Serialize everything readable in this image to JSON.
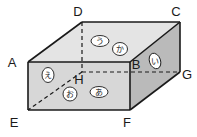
{
  "figure": {
    "shape_type": "cuboid",
    "background_color": "#ffffff",
    "edge_color": "#1a1a1a",
    "vertices": [
      {
        "id": "A",
        "label": "A",
        "x": 28,
        "y": 62,
        "hidden": false,
        "label_x": 12,
        "label_y": 67
      },
      {
        "id": "B",
        "label": "B",
        "x": 130,
        "y": 62,
        "hidden": false,
        "label_x": 133,
        "label_y": 69
      },
      {
        "id": "C",
        "label": "C",
        "x": 180,
        "y": 22,
        "hidden": false,
        "label_x": 172,
        "label_y": 16
      },
      {
        "id": "D",
        "label": "D",
        "x": 82,
        "y": 22,
        "hidden": false,
        "label_x": 74,
        "label_y": 16
      },
      {
        "id": "E",
        "label": "E",
        "x": 28,
        "y": 110,
        "hidden": false,
        "label_x": 12,
        "label_y": 127
      },
      {
        "id": "F",
        "label": "F",
        "x": 130,
        "y": 110,
        "hidden": false,
        "label_x": 124,
        "label_y": 127
      },
      {
        "id": "G",
        "label": "G",
        "x": 180,
        "y": 72,
        "hidden": false,
        "label_x": 182,
        "label_y": 79
      },
      {
        "id": "H",
        "label": "H",
        "x": 82,
        "y": 72,
        "hidden": true,
        "label_x": 75,
        "label_y": 84
      }
    ],
    "solid_edges": [
      "A-B",
      "B-C",
      "C-D",
      "D-A",
      "A-E",
      "B-F",
      "C-G",
      "E-F",
      "F-G"
    ],
    "dashed_edges": [
      "D-H",
      "H-G",
      "H-E"
    ],
    "face_tags": [
      {
        "id": "u",
        "label": "う",
        "face": "top",
        "x": 100,
        "y": 41
      },
      {
        "id": "ka",
        "label": "か",
        "face": "top",
        "x": 120,
        "y": 49
      },
      {
        "id": "i",
        "label": "い",
        "face": "right",
        "x": 155,
        "y": 61
      },
      {
        "id": "e",
        "label": "え",
        "face": "front-left",
        "x": 48,
        "y": 75
      },
      {
        "id": "o",
        "label": "お",
        "face": "front",
        "x": 70,
        "y": 94
      },
      {
        "id": "a",
        "label": "あ",
        "face": "front",
        "x": 99,
        "y": 92
      }
    ],
    "face_fills": {
      "top": "#e3e3e3",
      "front": "#d2d2d2",
      "right": "#b9b9b9",
      "left_band": "#cfcfcf"
    }
  }
}
